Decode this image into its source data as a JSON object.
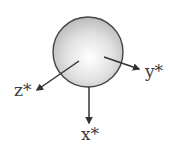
{
  "diagram": {
    "sphere": {
      "cx": 88,
      "cy": 52,
      "r": 35,
      "fill_center": "#ffffff",
      "fill_edge": "#bcbcbc",
      "stroke": "#444444"
    },
    "axes": [
      {
        "name": "x",
        "label": "x*",
        "x1": 89,
        "y1": 87,
        "x2": 89,
        "y2": 123
      },
      {
        "name": "y",
        "label": "y*",
        "x1": 104,
        "y1": 57,
        "x2": 139,
        "y2": 69
      },
      {
        "name": "z",
        "label": "z*",
        "x1": 79,
        "y1": 61,
        "x2": 37,
        "y2": 90
      }
    ],
    "arrow_color": "#333333"
  }
}
